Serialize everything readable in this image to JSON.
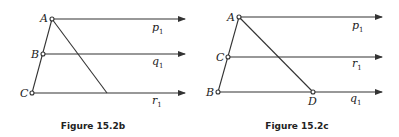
{
  "figures": [
    {
      "caption": "Figure 15.2b",
      "points": {
        "A": "A",
        "B": "B",
        "C": "C"
      },
      "lines": [
        {
          "name": "p",
          "sub": "1"
        },
        {
          "name": "q",
          "sub": "1"
        },
        {
          "name": "r",
          "sub": "1"
        }
      ]
    },
    {
      "caption": "Figure 15.2c",
      "points": {
        "A": "A",
        "C": "C",
        "B": "B",
        "D": "D"
      },
      "lines": [
        {
          "name": "p",
          "sub": "1"
        },
        {
          "name": "r",
          "sub": "1"
        },
        {
          "name": "q",
          "sub": "1"
        }
      ]
    }
  ],
  "colors": {
    "stroke": "#333333",
    "background": "#ffffff"
  }
}
